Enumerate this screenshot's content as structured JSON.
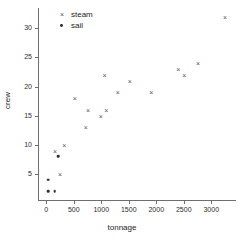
{
  "chart_data": {
    "type": "scatter",
    "title": "",
    "xlabel": "tonnage",
    "ylabel": "crew",
    "xlim": [
      -150,
      3450
    ],
    "ylim": [
      0.5,
      33.5
    ],
    "grid": false,
    "legend_position": "top-left",
    "xticks": [
      0,
      500,
      1000,
      1500,
      2000,
      2500,
      3000
    ],
    "xtick_labels": [
      "0",
      "500",
      "1000",
      "1500",
      "2000",
      "2500",
      "3000"
    ],
    "yticks": [
      5,
      10,
      15,
      20,
      25,
      30
    ],
    "ytick_labels": [
      "5",
      "10",
      "15",
      "20",
      "25",
      "30"
    ],
    "series": [
      {
        "name": "steam",
        "marker": "x",
        "color": "#555555",
        "points": [
          {
            "x": 160,
            "y": 9
          },
          {
            "x": 250,
            "y": 5
          },
          {
            "x": 330,
            "y": 10
          },
          {
            "x": 520,
            "y": 18
          },
          {
            "x": 720,
            "y": 13
          },
          {
            "x": 760,
            "y": 16
          },
          {
            "x": 990,
            "y": 15
          },
          {
            "x": 1060,
            "y": 22
          },
          {
            "x": 1090,
            "y": 16
          },
          {
            "x": 1300,
            "y": 19
          },
          {
            "x": 1520,
            "y": 21
          },
          {
            "x": 1910,
            "y": 19
          },
          {
            "x": 2400,
            "y": 23
          },
          {
            "x": 2510,
            "y": 22
          },
          {
            "x": 2760,
            "y": 24
          },
          {
            "x": 3250,
            "y": 32
          }
        ]
      },
      {
        "name": "sail",
        "marker": "o",
        "color": "#2e2e2e",
        "points": [
          {
            "x": 40,
            "y": 4
          },
          {
            "x": 40,
            "y": 2
          },
          {
            "x": 150,
            "y": 2
          },
          {
            "x": 215,
            "y": 8
          }
        ]
      }
    ]
  },
  "legend": {
    "items": [
      {
        "label": "steam",
        "glyph": "×",
        "key_name": "legend-marker-steam"
      },
      {
        "label": "sail",
        "glyph": "•",
        "key_name": "legend-marker-sail"
      }
    ]
  },
  "axes": {
    "x_title": "tonnage",
    "y_title": "crew"
  }
}
